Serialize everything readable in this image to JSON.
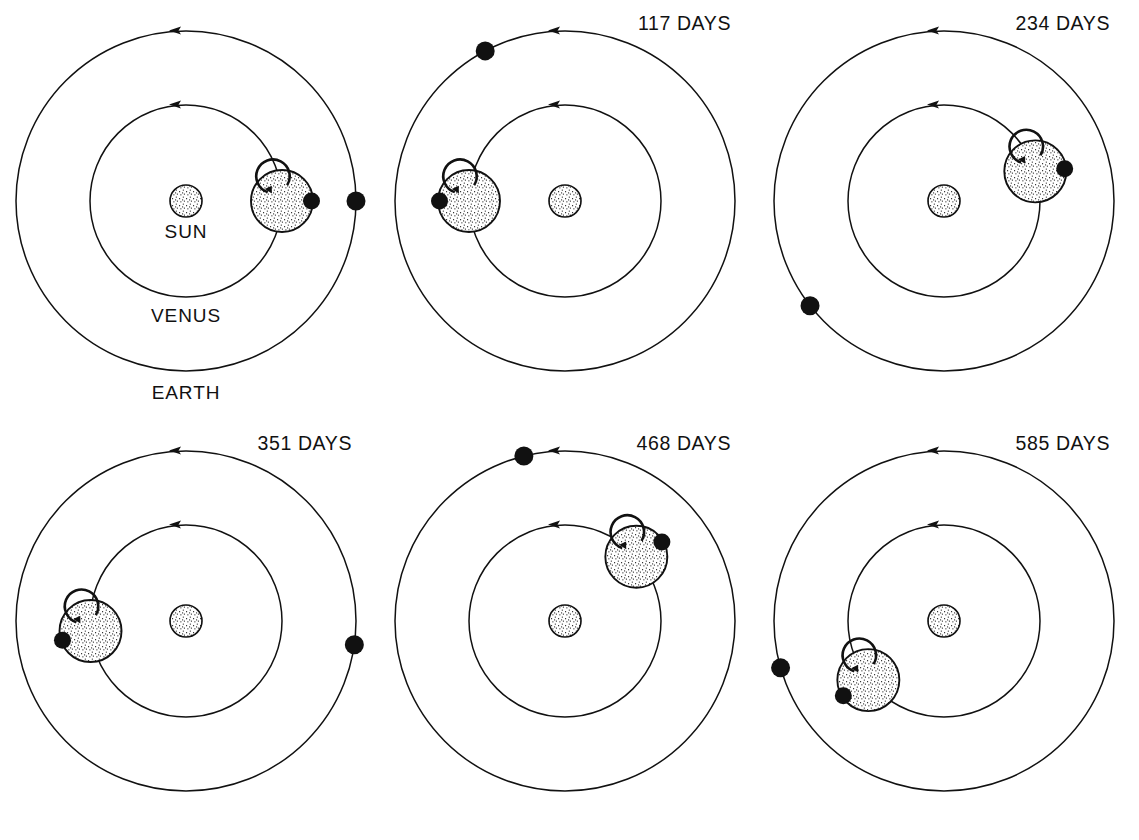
{
  "figure": {
    "background": "#ffffff",
    "ink_color": "#111111"
  },
  "legend_labels": {
    "sun": "SUN",
    "venus": "VENUS",
    "earth": "EARTH"
  },
  "geometry": {
    "panel_width": 379,
    "panel_height": 420,
    "center_x": 186,
    "center_y": 201,
    "earth_orbit_radius": 170,
    "venus_orbit_radius": 96,
    "sun_radius": 16,
    "venus_disc_radius": 31,
    "earth_dot_radius": 9.5,
    "venus_dot_radius": 8.5,
    "orbit_direction": "counterclockwise"
  },
  "chart_data": {
    "type": "diagram",
    "units": "days",
    "panels": [
      {
        "index": 0,
        "label": "",
        "days": 0,
        "venus_orbit_angle_deg": 0,
        "venus_spot_angle_deg": 0,
        "earth_orbit_angle_deg": 0,
        "show_body_labels": true
      },
      {
        "index": 1,
        "label": "117 DAYS",
        "days": 117,
        "venus_orbit_angle_deg": 180,
        "venus_spot_angle_deg": 180,
        "earth_orbit_angle_deg": 118,
        "show_body_labels": false
      },
      {
        "index": 2,
        "label": "234 DAYS",
        "days": 234,
        "venus_orbit_angle_deg": 18,
        "venus_spot_angle_deg": 5,
        "earth_orbit_angle_deg": 218,
        "show_body_labels": false
      },
      {
        "index": 3,
        "label": "351 DAYS",
        "days": 351,
        "venus_orbit_angle_deg": 186,
        "venus_spot_angle_deg": 198,
        "earth_orbit_angle_deg": 352,
        "show_body_labels": false
      },
      {
        "index": 4,
        "label": "468 DAYS",
        "days": 468,
        "venus_orbit_angle_deg": 42,
        "venus_spot_angle_deg": 30,
        "earth_orbit_angle_deg": 104,
        "show_body_labels": false
      },
      {
        "index": 5,
        "label": "585 DAYS",
        "days": 585,
        "venus_orbit_angle_deg": 218,
        "venus_spot_angle_deg": 212,
        "earth_orbit_angle_deg": 196,
        "show_body_labels": false
      }
    ]
  }
}
